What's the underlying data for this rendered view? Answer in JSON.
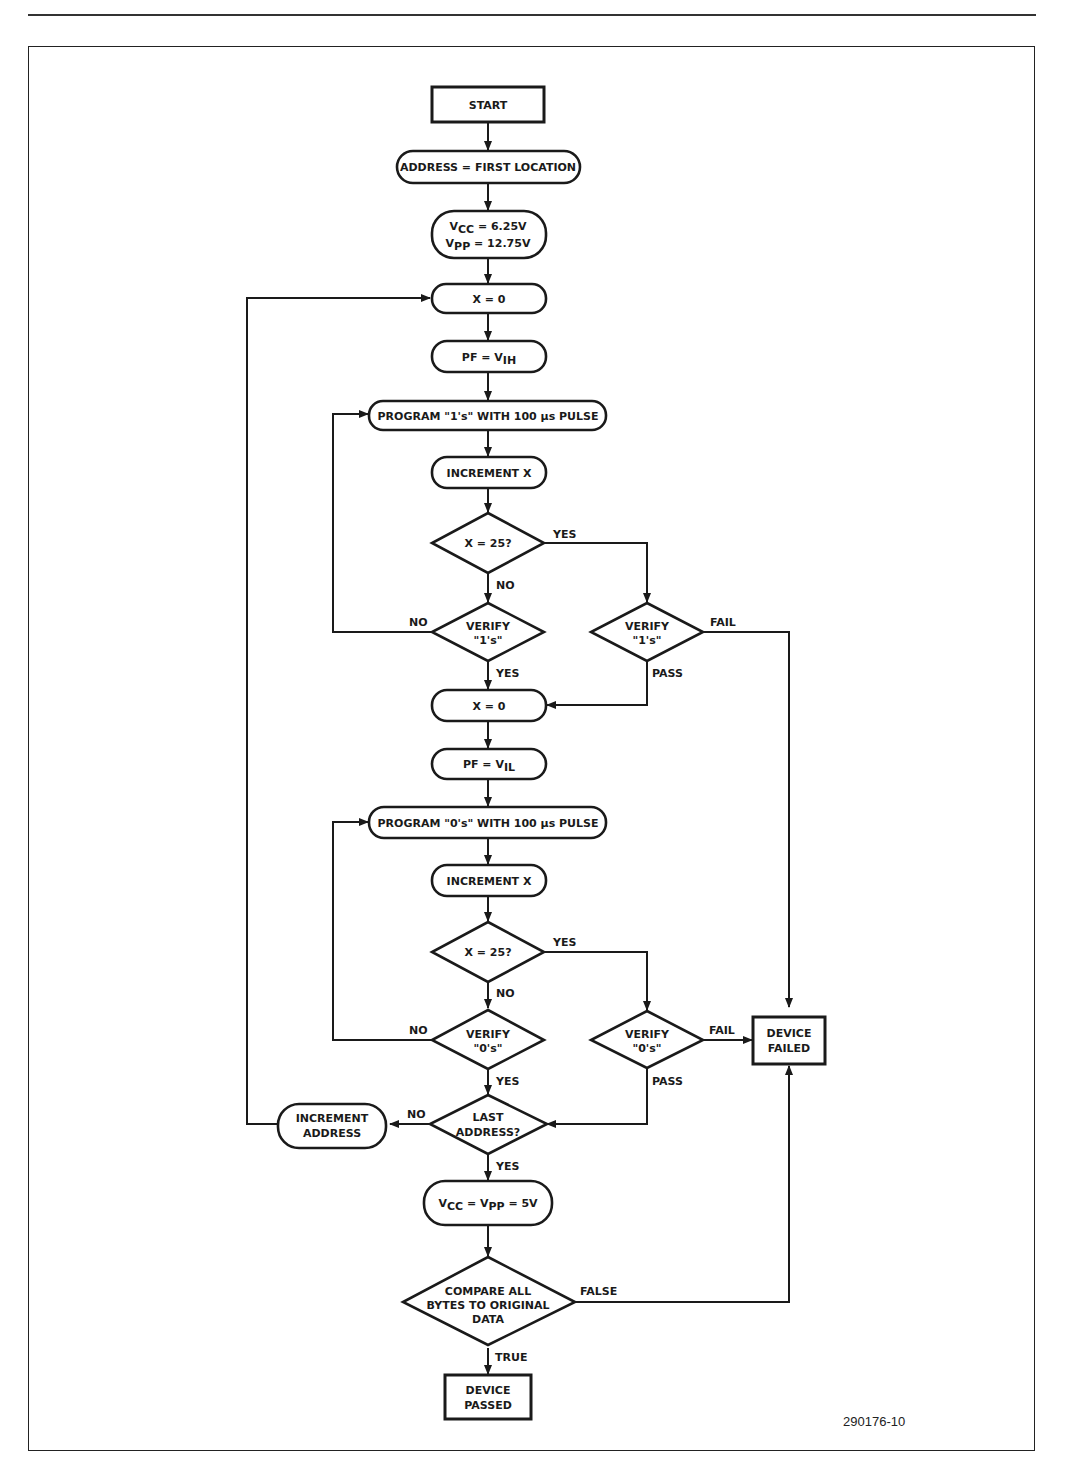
{
  "figure": {
    "id": "290176-10",
    "nodes": {
      "start": "START",
      "address_first": "ADDRESS = FIRST LOCATION",
      "vcc_set": {
        "line1_main": "V",
        "line1_sub": "CC",
        "line1_rest": " = 6.25V",
        "line2_main": "V",
        "line2_sub": "PP",
        "line2_rest": " = 12.75V"
      },
      "x0_a": "X = 0",
      "pf_vih": {
        "main": "PF = V",
        "sub": "IH"
      },
      "program_1s": "PROGRAM \"1's\" WITH 100 μs PULSE",
      "increment_x_a": "INCREMENT X",
      "x25_a": "X = 25?",
      "verify_1s_left": {
        "line1": "VERIFY",
        "line2": "\"1's\""
      },
      "verify_1s_right": {
        "line1": "VERIFY",
        "line2": "\"1's\""
      },
      "x0_b": "X = 0",
      "pf_vil": {
        "main": "PF = V",
        "sub": "IL"
      },
      "program_0s": "PROGRAM \"0's\" WITH 100 μs PULSE",
      "increment_x_b": "INCREMENT X",
      "x25_b": "X = 25?",
      "verify_0s_left": {
        "line1": "VERIFY",
        "line2": "\"0's\""
      },
      "verify_0s_right": {
        "line1": "VERIFY",
        "line2": "\"0's\""
      },
      "device_failed": {
        "line1": "DEVICE",
        "line2": "FAILED"
      },
      "last_address": {
        "line1": "LAST",
        "line2": "ADDRESS?"
      },
      "increment_address": {
        "line1": "INCREMENT",
        "line2": "ADDRESS"
      },
      "vcc_vpp_5v": {
        "m1": "V",
        "s1": "CC",
        "mid": " = V",
        "s2": "PP",
        "rest": " = 5V"
      },
      "compare": {
        "line1": "COMPARE ALL",
        "line2": "BYTES TO ORIGINAL",
        "line3": "DATA"
      },
      "device_passed": {
        "line1": "DEVICE",
        "line2": "PASSED"
      }
    },
    "edge_labels": {
      "yes": "YES",
      "no": "NO",
      "fail": "FAIL",
      "pass": "PASS",
      "true": "TRUE",
      "false": "FALSE"
    }
  }
}
